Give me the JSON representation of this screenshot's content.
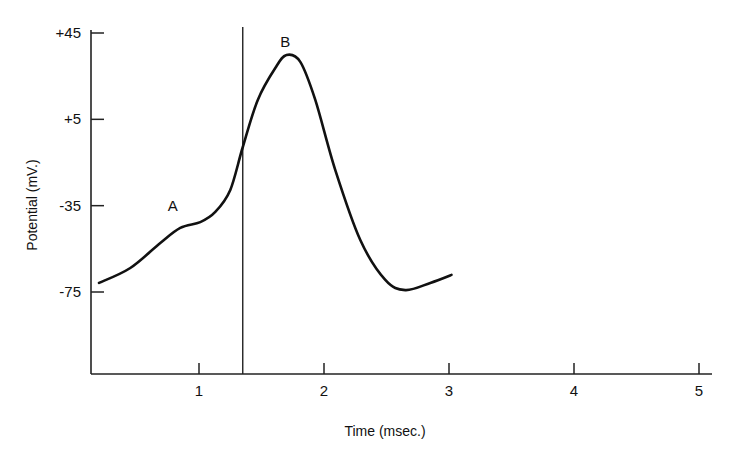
{
  "chart_data": {
    "type": "line",
    "title": "",
    "xlabel": "Time (msec.)",
    "ylabel": "Potential (mV.)",
    "xlim": [
      0.14,
      5.1
    ],
    "ylim": [
      -110,
      45
    ],
    "x_ticks": [
      1,
      2,
      3,
      4,
      5
    ],
    "x_tick_labels": [
      "1",
      "2",
      "3",
      "4",
      "5"
    ],
    "y_ticks": [
      45,
      5,
      -35,
      -75
    ],
    "y_tick_labels": [
      "+45",
      "+5",
      "-35",
      "-75"
    ],
    "grid": false,
    "legend": "none",
    "series": [
      {
        "name": "action potential",
        "x": [
          0.2,
          0.45,
          0.69,
          0.85,
          1.01,
          1.13,
          1.25,
          1.35,
          1.47,
          1.61,
          1.7,
          1.81,
          1.93,
          2.09,
          2.29,
          2.49,
          2.65,
          2.85,
          3.02
        ],
        "y": [
          -70.8,
          -63.9,
          -52.3,
          -45.3,
          -42.6,
          -37.9,
          -27.7,
          -7.8,
          14.0,
          28.8,
          34.8,
          31.6,
          14.0,
          -18.5,
          -50.9,
          -69.4,
          -74.1,
          -70.8,
          -67.1
        ]
      }
    ],
    "vertical_marker": {
      "x": 1.35,
      "y_top": 45
    },
    "annotations": [
      {
        "text": "A",
        "x": 0.79,
        "y": -35
      },
      {
        "text": "B",
        "x": 1.69,
        "y": 41
      }
    ]
  }
}
